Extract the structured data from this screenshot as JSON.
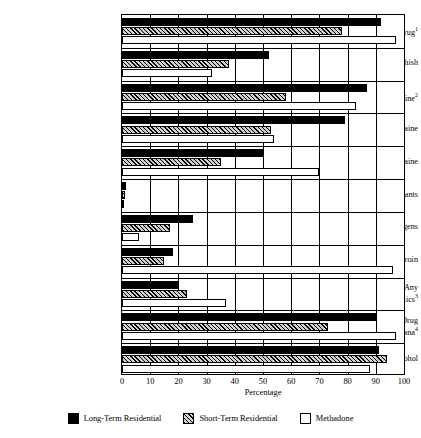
{
  "chart_data": {
    "type": "bar",
    "orientation": "horizontal",
    "title": "",
    "xlabel": "Percentage",
    "ylabel": "",
    "xlim": [
      0,
      100
    ],
    "xticks": [
      0,
      10,
      20,
      30,
      40,
      50,
      60,
      70,
      80,
      90,
      100
    ],
    "grid": true,
    "legend_position": "bottom",
    "categories": [
      "Any Illicit Drug",
      "Marijuana/Hashish",
      "Any Cocaine",
      "Crack Cocaine",
      "Other Cocaine",
      "Inhalants",
      "Hallucinogens",
      "Heroin",
      "Nonmedical Use of Any Psychotherapeutics",
      "Any Illicit Drug Except Marijuana",
      "Any Alcohol"
    ],
    "category_footnotes": [
      "1",
      "",
      "2",
      "",
      "",
      "",
      "",
      "",
      "3",
      "4",
      ""
    ],
    "series": [
      {
        "name": "Long-Term Residential",
        "pattern": "solid-black",
        "color": "#000000",
        "values": [
          92,
          52,
          87,
          79,
          50,
          1.5,
          25,
          18,
          20,
          90,
          91
        ]
      },
      {
        "name": "Short-Term Residential",
        "pattern": "hatched",
        "color": "#cfcfcf",
        "values": [
          78,
          38,
          58,
          53,
          35,
          1,
          17,
          15,
          23,
          73,
          94
        ]
      },
      {
        "name": "Methadone",
        "pattern": "white",
        "color": "#ffffff",
        "values": [
          97,
          32,
          83,
          54,
          70,
          0.5,
          6,
          96,
          37,
          97,
          88
        ]
      }
    ]
  },
  "axis": {
    "x_title": "Percentage",
    "tick_labels": [
      "0",
      "10",
      "20",
      "30",
      "40",
      "50",
      "60",
      "70",
      "80",
      "90",
      "100"
    ]
  },
  "y_labels": [
    {
      "line1": "Any Illicit Drug",
      "sup": "1",
      "line2": ""
    },
    {
      "line1": "Marijuana/Hashish",
      "sup": "",
      "line2": ""
    },
    {
      "line1": "Any Cocaine",
      "sup": "2",
      "line2": ""
    },
    {
      "line1": "Crack Cocaine",
      "sup": "",
      "line2": ""
    },
    {
      "line1": "Other Cocaine",
      "sup": "",
      "line2": ""
    },
    {
      "line1": "Inhalants",
      "sup": "",
      "line2": ""
    },
    {
      "line1": "Hallucinogens",
      "sup": "",
      "line2": ""
    },
    {
      "line1": "Heroin",
      "sup": "",
      "line2": ""
    },
    {
      "line1": "Nonmedical Use of Any",
      "sup": "3",
      "line2": "Psychotherapeutics"
    },
    {
      "line1": "Any Illicit Drug",
      "sup": "4",
      "line2": "Except Marijuana"
    },
    {
      "line1": "Any Alcohol",
      "sup": "",
      "line2": ""
    }
  ],
  "legend": {
    "items": [
      {
        "label": "Long-Term Residential",
        "style": "longterm"
      },
      {
        "label": "Short-Term Residential",
        "style": "shortterm"
      },
      {
        "label": "Methadone",
        "style": "methadone"
      }
    ]
  }
}
